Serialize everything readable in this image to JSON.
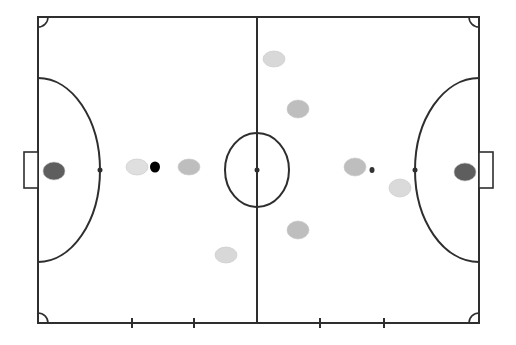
{
  "diagram": {
    "type": "futsal-court-formation",
    "court": {
      "left": 38,
      "top": 17,
      "right": 479,
      "bottom": 323,
      "halfway_x": 257,
      "line_color": "#2e2e2e",
      "background": "#ffffff"
    },
    "center_circle": {
      "cx": 257,
      "cy": 170,
      "rx": 32,
      "ry": 37
    },
    "center_spot": {
      "cx": 257,
      "cy": 170,
      "r": 2.5
    },
    "goals": [
      {
        "side": "left",
        "x": 24,
        "y": 152,
        "w": 14,
        "h": 36
      },
      {
        "side": "right",
        "x": 479,
        "y": 152,
        "w": 14,
        "h": 36
      }
    ],
    "penalty_areas": [
      {
        "side": "left",
        "apex_x": 100,
        "top_y": 78,
        "bottom_y": 262
      },
      {
        "side": "right",
        "apex_x": 415,
        "top_y": 78,
        "bottom_y": 262
      }
    ],
    "penalty_spots": [
      {
        "cx": 100,
        "cy": 170,
        "r": 2.5
      },
      {
        "cx": 415,
        "cy": 170,
        "r": 2.5
      }
    ],
    "substitution_ticks_x": [
      132,
      194,
      320,
      384
    ],
    "corner_arc_radius": 10,
    "players": [
      {
        "id": "left-goalkeeper",
        "cx": 54,
        "cy": 171,
        "rx": 11,
        "ry": 9,
        "color": "#555555"
      },
      {
        "id": "left-player-1",
        "cx": 137,
        "cy": 167,
        "rx": 11,
        "ry": 8,
        "color": "#dddddd"
      },
      {
        "id": "left-player-2",
        "cx": 189,
        "cy": 167,
        "rx": 11,
        "ry": 8,
        "color": "#bbbbbb"
      },
      {
        "id": "left-player-3",
        "cx": 226,
        "cy": 255,
        "rx": 11,
        "ry": 8,
        "color": "#d6d6d6"
      },
      {
        "id": "right-player-1",
        "cx": 274,
        "cy": 59,
        "rx": 11,
        "ry": 8,
        "color": "#d6d6d6"
      },
      {
        "id": "right-player-2",
        "cx": 298,
        "cy": 109,
        "rx": 11,
        "ry": 9,
        "color": "#bbbbbb"
      },
      {
        "id": "right-player-3",
        "cx": 298,
        "cy": 230,
        "rx": 11,
        "ry": 9,
        "color": "#bbbbbb"
      },
      {
        "id": "right-player-4",
        "cx": 355,
        "cy": 167,
        "rx": 11,
        "ry": 9,
        "color": "#bbbbbb"
      },
      {
        "id": "right-player-5",
        "cx": 400,
        "cy": 188,
        "rx": 11,
        "ry": 9,
        "color": "#d8d8d8"
      },
      {
        "id": "right-goalkeeper",
        "cx": 465,
        "cy": 172,
        "rx": 11,
        "ry": 9,
        "color": "#555555"
      }
    ],
    "balls": [
      {
        "id": "ball-large",
        "cx": 155,
        "cy": 167,
        "rx": 5,
        "ry": 5.5,
        "color": "#000000"
      },
      {
        "id": "ball-small",
        "cx": 372,
        "cy": 170,
        "rx": 2.5,
        "ry": 3,
        "color": "#333333"
      }
    ]
  }
}
